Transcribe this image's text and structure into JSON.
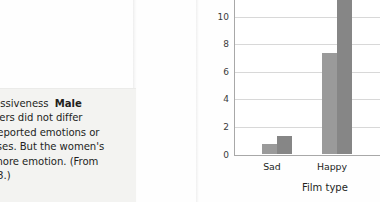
{
  "caption": {
    "text": "xpressiveness  Male\nriewers did not differ\nelf-reported emotions or\nponses. But the women's\nch more emotion. (From\n1998.)",
    "bold_fragment": "Male",
    "clipped": "true"
  },
  "chart_data": {
    "type": "bar",
    "title": "",
    "xlabel": "Film type",
    "ylabel": "",
    "categories": [
      "Sad",
      "Happy"
    ],
    "series": [
      {
        "name": "series-1",
        "values": [
          0.7,
          7.3
        ],
        "color": "#9a9a9a"
      },
      {
        "name": "series-2",
        "values": [
          1.3,
          11.6
        ],
        "color": "#868686"
      }
    ],
    "ylim": [
      0,
      11.2
    ],
    "yticks": [
      0,
      2,
      4,
      6,
      8,
      10
    ],
    "ytick_labels": [
      "0",
      "2",
      "4",
      "6",
      "8",
      "10"
    ],
    "grid": "horizontal",
    "legend": "none"
  },
  "colors": {
    "bar_light": "#9a9a9a",
    "bar_dark": "#868686",
    "gridline": "#d8d8d8",
    "axis": "#a8a8a8",
    "text": "#231f1d",
    "caption_panel": "#f3f3f1",
    "page": "#fefefe"
  }
}
